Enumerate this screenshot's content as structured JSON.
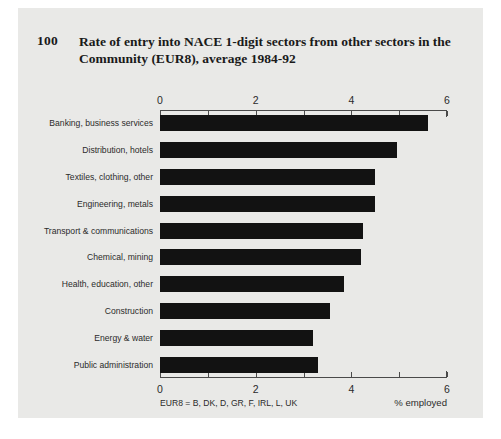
{
  "figure": {
    "number": "100",
    "title": "Rate of entry into NACE 1-digit sectors from other sectors in the Community (EUR8), average 1984-92",
    "footnote": "EUR8 = B, DK, D, GR, F, IRL, L, UK",
    "background_color": "#e9e9e7",
    "bar_color": "#121212",
    "axis_color": "#4a4a4a"
  },
  "chart_data": {
    "type": "bar",
    "orientation": "horizontal",
    "title": "Rate of entry into NACE 1-digit sectors from other sectors in the Community (EUR8), average 1984-92",
    "subtitle": "",
    "xlabel": "% employed",
    "ylabel": "",
    "xlim": [
      0,
      6
    ],
    "xticks": [
      0,
      1,
      2,
      3,
      4,
      5,
      6
    ],
    "xtick_labels": [
      "0",
      "",
      "2",
      "",
      "4",
      "",
      "6"
    ],
    "xtick_labels_major": [
      "0",
      "2",
      "4",
      "6"
    ],
    "grid": false,
    "legend": null,
    "axis_top": true,
    "axis_bottom": true,
    "annotation": "EUR8 = B, DK, D, GR, F, IRL, L, UK",
    "categories": [
      "Banking, business services",
      "Distribution, hotels",
      "Textiles, clothing, other",
      "Engineering, metals",
      "Transport & communications",
      "Chemical, mining",
      "Health, education, other",
      "Construction",
      "Energy & water",
      "Public administration"
    ],
    "values": [
      5.6,
      4.95,
      4.5,
      4.5,
      4.25,
      4.2,
      3.85,
      3.55,
      3.2,
      3.3
    ]
  }
}
